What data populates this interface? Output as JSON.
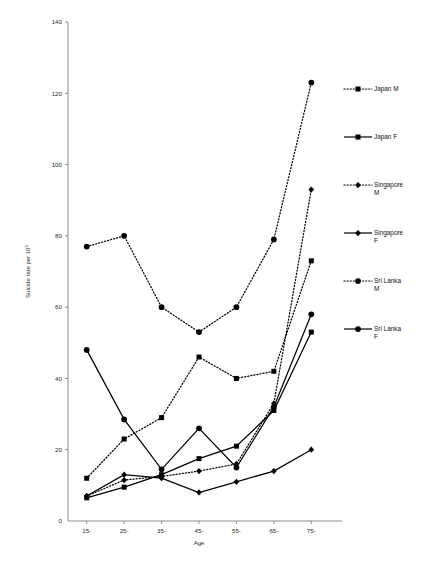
{
  "chart_data": {
    "type": "line",
    "title": "",
    "xlabel": "Age",
    "ylabel": "Suicide rate per 10",
    "ylabel_sup": "5",
    "categories": [
      "15-",
      "25-",
      "35-",
      "45-",
      "55-",
      "65-",
      "75-"
    ],
    "ylim": [
      0,
      140
    ],
    "yticks": [
      0,
      20,
      40,
      60,
      80,
      100,
      120,
      140
    ],
    "ytick_labels": [
      "0",
      "20",
      "40",
      "60",
      "80",
      "100",
      "120",
      "140"
    ],
    "grid": false,
    "legend_position": "right",
    "series": [
      {
        "name": "Japan M",
        "label": "Japan M",
        "line": "dotted",
        "marker": "square",
        "values": [
          12,
          23,
          29,
          46,
          40,
          42,
          73
        ]
      },
      {
        "name": "Japan F",
        "label": "Japan F",
        "line": "solid",
        "marker": "square",
        "values": [
          6.5,
          9.5,
          13,
          17.5,
          21,
          31,
          53
        ]
      },
      {
        "name": "Singapore M",
        "label": "Singapore M",
        "line": "dotted",
        "marker": "diamond",
        "values": [
          7,
          11.5,
          12.5,
          14,
          16,
          33,
          93
        ]
      },
      {
        "name": "Singapore F",
        "label": "Singapore F",
        "line": "solid",
        "marker": "diamond",
        "values": [
          7,
          13,
          12,
          8,
          11,
          14,
          20
        ]
      },
      {
        "name": "Sri Lanka M",
        "label": "Sri Lanka M",
        "line": "dotted",
        "marker": "circle",
        "values": [
          77,
          80,
          60,
          53,
          60,
          79,
          123
        ]
      },
      {
        "name": "Sri Lanka F",
        "label": "Sri Lanka F",
        "line": "solid",
        "marker": "circle",
        "values": [
          48,
          28.5,
          14.5,
          26,
          15,
          32,
          58
        ]
      }
    ]
  },
  "legend": {
    "entries": [
      {
        "label": "Japan M",
        "line": "dotted",
        "marker": "square"
      },
      {
        "label": "Japan F",
        "line": "solid",
        "marker": "square"
      },
      {
        "label": "Singapore M",
        "line": "dotted",
        "marker": "diamond",
        "wrap": [
          "Singapore",
          "M"
        ]
      },
      {
        "label": "Singapore F",
        "line": "solid",
        "marker": "diamond",
        "wrap": [
          "Singapore",
          "F"
        ]
      },
      {
        "label": "Sri Lanka M",
        "line": "dotted",
        "marker": "circle",
        "wrap": [
          "Sri Lanka",
          "M"
        ]
      },
      {
        "label": "Sri Lanka F",
        "line": "solid",
        "marker": "circle",
        "wrap": [
          "Sri Lanka",
          "F"
        ]
      }
    ]
  },
  "colors": {
    "ink": "#000000",
    "axis": "#8d8d8d",
    "background": "#ffffff"
  }
}
